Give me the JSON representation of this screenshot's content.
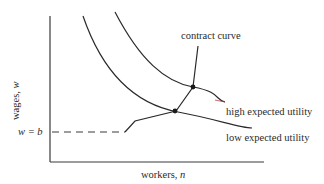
{
  "diagram": {
    "axes": {
      "y_label": "wages, ",
      "y_var": "w",
      "x_label": "workers, ",
      "x_var": "n"
    },
    "labels": {
      "contract_curve": "contract curve",
      "high_utility": "high expected utility",
      "low_utility": "low expected utility",
      "reservation_wage": "w = b"
    },
    "colors": {
      "line": "#2a2a2a",
      "curve_tail_tint": "#b0333a"
    }
  }
}
